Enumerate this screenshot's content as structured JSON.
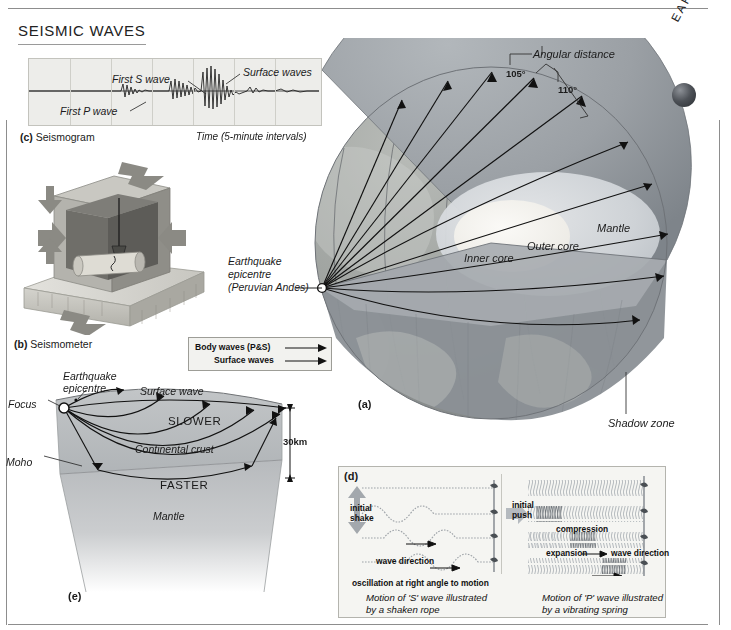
{
  "page": {
    "title": "SEISMIC WAVES"
  },
  "seismogram": {
    "panel_label": "(c)",
    "caption": "Seismogram",
    "time_axis": "Time (5-minute intervals)",
    "annotations": [
      "First P wave",
      "First S wave",
      "Surface waves"
    ],
    "gridlines": 7
  },
  "seismometer": {
    "panel_label": "(b)",
    "caption": "Seismometer"
  },
  "legend": {
    "body_waves": "Body waves (P&S)",
    "surface_waves": "Surface waves"
  },
  "earth": {
    "panel_label": "(a)",
    "word": "EARTH",
    "epicentre": "Earthquake\nepicentre\n(Peruvian Andes)",
    "epicentre_line1": "Earthquake",
    "epicentre_line2": "epicentre",
    "epicentre_line3": "(Peruvian Andes)",
    "angular_distance": "Angular distance",
    "angle_105": "105°",
    "angle_110": "110°",
    "mantle": "Mantle",
    "outer_core": "Outer core",
    "inner_core": "Inner core",
    "shadow_zone": "Shadow zone"
  },
  "crust": {
    "panel_label": "(e)",
    "focus": "Focus",
    "epicentre_line1": "Earthquake",
    "epicentre_line2": "epicentre",
    "surface_wave": "Surface wave",
    "slower": "SLOWER",
    "continental_crust": "Continental crust",
    "moho": "Moho",
    "faster": "FASTER",
    "mantle": "Mantle",
    "depth": "30km"
  },
  "wave_motion": {
    "panel_label": "(d)",
    "s_wave": {
      "initial_shake_line1": "initial",
      "initial_shake_line2": "shake",
      "wave_direction": "wave direction",
      "oscillation": "oscillation at right angle to motion",
      "caption_line1": "Motion of 'S' wave illustrated",
      "caption_line2": "by a shaken rope"
    },
    "p_wave": {
      "initial_push_line1": "initial",
      "initial_push_line2": "push",
      "compression": "compression",
      "expansion": "expansion",
      "wave_direction": "wave direction",
      "caption_line1": "Motion of 'P' wave illustrated",
      "caption_line2": "by a vibrating spring"
    }
  },
  "colors": {
    "mantle": "#9aa0a6",
    "outer_core": "#d7dade",
    "inner_core": "#f3f2ee",
    "crust": "#b9bcbf",
    "panel_bg": "#f5f5f2",
    "rule": "#8d8d8d"
  }
}
